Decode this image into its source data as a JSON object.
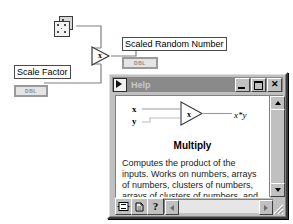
{
  "diagram": {
    "random_node": {
      "name": "random-number-generator",
      "tooltip": ""
    },
    "multiply_node": {
      "glyph": "x"
    },
    "terminals": [
      {
        "id": "scaled",
        "label": "Scaled Random Number",
        "datatype": "DBL"
      },
      {
        "id": "scale",
        "label": "Scale Factor",
        "datatype": "DBL"
      }
    ]
  },
  "help_window": {
    "title": "Help",
    "icon": "labview-help-icon",
    "buttons": {
      "minimize": "_",
      "maximize": "□",
      "close": "✕"
    },
    "content": {
      "input_x": "x",
      "input_y": "y",
      "output": "x*y",
      "node_glyph": "x",
      "heading": "Multiply",
      "body": "Computes the product of the inputs. Works on numbers, arrays of numbers, clusters of numbers, arrays of clusters of numbers, and so on."
    },
    "toolbar": {
      "show_detail_label": "",
      "lock_label": "",
      "help_label": "?"
    },
    "scrollbars": {
      "vertical": "vertical-scrollbar",
      "horizontal": "horizontal-scrollbar"
    }
  },
  "colors": {
    "window_face": "#c0c0c0",
    "titlebar": "#8a8a8a",
    "titlebar_text": "#c8c8c8",
    "wire": "#808080",
    "terminal_border": "#4a4a4a",
    "dbl_box": "#9a9a9a"
  }
}
